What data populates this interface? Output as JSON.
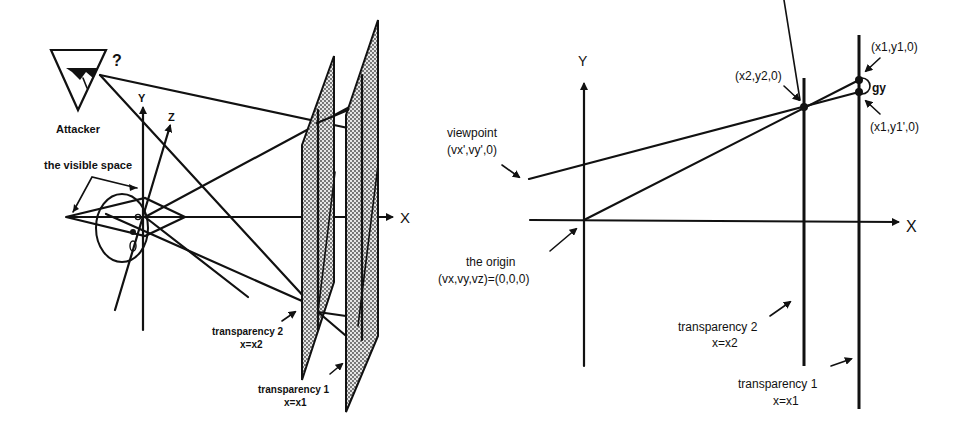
{
  "left_diagram": {
    "attacker": {
      "label": "Attacker",
      "question_mark": "?"
    },
    "visible_space_label": "the visible space",
    "axes": {
      "y": "Y",
      "z": "Z",
      "x": "X"
    },
    "transparency_2": {
      "name": "transparency 2",
      "eq": "x=x2"
    },
    "transparency_1": {
      "name": "transparency 1",
      "eq": "x=x1"
    }
  },
  "right_diagram": {
    "axes": {
      "y": "Y",
      "x": "X"
    },
    "viewpoint": {
      "name": "viewpoint",
      "coords": "(vx',vy',0)"
    },
    "origin": {
      "name": "the origin",
      "coords": "(vx,vy,vz)=(0,0,0)"
    },
    "point_x2y2": "(x2,y2,0)",
    "point_x1y1": "(x1,y1,0)",
    "point_x1y1p": "(x1,y1',0)",
    "gap_label": "gy",
    "transparency_2": {
      "name": "transparency 2",
      "eq": "x=x2"
    },
    "transparency_1": {
      "name": "transparency 1",
      "eq": "x=x1"
    }
  },
  "colors": {
    "ink": "#111111",
    "background": "#ffffff",
    "stipple": "#b8b8b8"
  }
}
